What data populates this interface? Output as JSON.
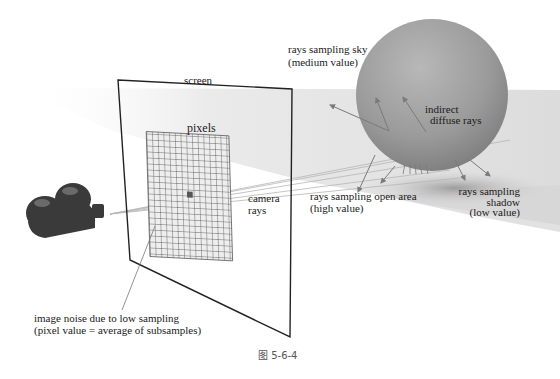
{
  "figure": {
    "caption": "图 5-6-4",
    "labels": {
      "screen": "screen",
      "pixels": "pixels",
      "camera_rays_line1": "camera",
      "camera_rays_line2": "rays",
      "sky_line1": "rays sampling sky",
      "sky_line2": "(medium value)",
      "indirect_line1": "indirect",
      "indirect_line2": "diffuse rays",
      "open_line1": "rays sampling open area",
      "open_line2": "(high value)",
      "shadow_line1": "rays sampling",
      "shadow_line2": "shadow",
      "shadow_line3": "(low value)",
      "noise_line1": "image noise due to low sampling",
      "noise_line2": "(pixel value = average of subsamples)"
    },
    "icons": {
      "camera": "movie-camera-icon",
      "sphere": "sphere-object"
    },
    "colors": {
      "sphere": "#9a9a9a",
      "camera": "#3a3a3a",
      "grid": "#555555",
      "frame": "#222222",
      "ground": "#e6e6e6",
      "rays": "#8a8a8a"
    }
  }
}
